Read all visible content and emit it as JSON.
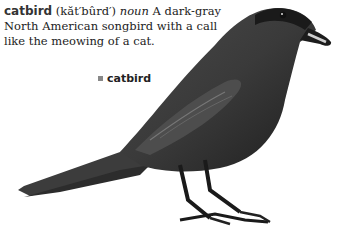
{
  "entry": {
    "headword": "catbird",
    "pronunciation": "(kăt′bûrd′)",
    "part_of_speech": "noun",
    "definition": "A dark-gray North American songbird with a call like the meowing of a cat."
  },
  "illustration": {
    "caption": "catbird",
    "caption_marker_icon": "square-bullet-icon",
    "bird_color": "#3a3a3a"
  }
}
